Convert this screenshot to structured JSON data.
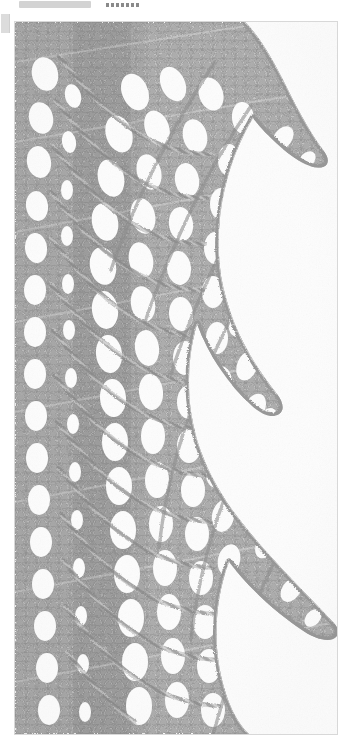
{
  "page": {
    "background_color": "#ffffff",
    "width": 350,
    "height": 752
  },
  "header": {
    "bar_label": "",
    "bar_color": "#d3d3d3",
    "dots_label": "......."
  },
  "side_tab": {
    "label": "",
    "color": "#dcdcdc"
  },
  "photo": {
    "alt_text": "Close-up photograph of hand-knitted grey lace edging with scalloped pointed border",
    "subject": "knitted lace edging",
    "frame_border_color": "#d8d8d8",
    "yarn_color": "#8e8e8e",
    "yarn_highlight_color": "#d8d8d8",
    "yarn_shadow_color": "#6a6a6a",
    "background_color": "#fdfdfd"
  }
}
